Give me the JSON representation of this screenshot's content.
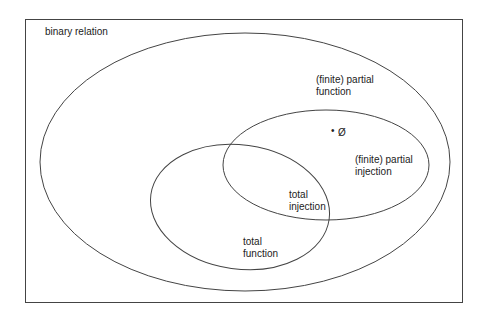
{
  "diagram": {
    "type": "euler",
    "colors": {
      "stroke": "#444444",
      "text": "#222222",
      "background": "#ffffff"
    },
    "frame": {
      "label": "binary relation"
    },
    "sets": [
      {
        "id": "partial-function",
        "line1": "(finite) partial",
        "line2": "function"
      },
      {
        "id": "partial-injection",
        "line1": "(finite) partial",
        "line2": "injection"
      },
      {
        "id": "total-function",
        "line1": "total",
        "line2": "function"
      },
      {
        "id": "total-injection",
        "line1": "total",
        "line2": "injection"
      }
    ],
    "empty_set": {
      "bullet": "•",
      "symbol": "Ø"
    }
  }
}
